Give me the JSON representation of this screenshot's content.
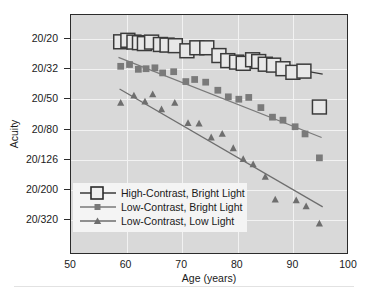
{
  "chart_data": {
    "type": "scatter",
    "title": "",
    "xlabel": "Age (years)",
    "ylabel": "Acuity",
    "xlim": [
      50,
      100
    ],
    "ylim_index": [
      0,
      6
    ],
    "grid": true,
    "legend_position": "lower-left",
    "xticks": [
      50,
      60,
      70,
      80,
      90,
      100
    ],
    "xtick_labels": [
      "50",
      "60",
      "70",
      "80",
      "90",
      "100"
    ],
    "ytick_labels": [
      "20/20",
      "20/32",
      "20/50",
      "20/80",
      "20/126",
      "20/200",
      "20/320"
    ],
    "ytick_index": [
      0,
      1,
      2,
      3,
      4,
      5,
      6
    ],
    "series": [
      {
        "name": "High-Contrast, Bright Light",
        "marker": "open-square",
        "marker_size": 7,
        "color": "#3a3a3a",
        "fill": "#e8e8e8",
        "points": [
          {
            "x": 59.0,
            "y": 0.1
          },
          {
            "x": 60.3,
            "y": 0.05
          },
          {
            "x": 61.4,
            "y": 0.11
          },
          {
            "x": 62.4,
            "y": 0.13
          },
          {
            "x": 63.3,
            "y": 0.16
          },
          {
            "x": 64.6,
            "y": 0.11
          },
          {
            "x": 66.2,
            "y": 0.19
          },
          {
            "x": 67.4,
            "y": 0.21
          },
          {
            "x": 68.9,
            "y": 0.23
          },
          {
            "x": 71.0,
            "y": 0.4
          },
          {
            "x": 72.8,
            "y": 0.3
          },
          {
            "x": 74.6,
            "y": 0.3
          },
          {
            "x": 76.8,
            "y": 0.56
          },
          {
            "x": 78.4,
            "y": 0.73
          },
          {
            "x": 80.0,
            "y": 0.78
          },
          {
            "x": 81.2,
            "y": 0.82
          },
          {
            "x": 82.9,
            "y": 0.7
          },
          {
            "x": 84.0,
            "y": 0.76
          },
          {
            "x": 85.2,
            "y": 0.85
          },
          {
            "x": 86.7,
            "y": 0.88
          },
          {
            "x": 88.4,
            "y": 1.0
          },
          {
            "x": 90.2,
            "y": 1.12
          },
          {
            "x": 92.2,
            "y": 1.08
          },
          {
            "x": 95.0,
            "y": 2.28
          }
        ],
        "fit_line": {
          "x0": 58.6,
          "y0": -0.05,
          "x1": 95.6,
          "y1": 1.18
        }
      },
      {
        "name": "Low-Contrast, Bright Light",
        "marker": "filled-square",
        "marker_size": 3.4,
        "color": "#7a7a7a",
        "points": [
          {
            "x": 59.0,
            "y": 0.92
          },
          {
            "x": 60.6,
            "y": 0.86
          },
          {
            "x": 62.2,
            "y": 1.02
          },
          {
            "x": 63.6,
            "y": 1.0
          },
          {
            "x": 65.2,
            "y": 0.97
          },
          {
            "x": 66.6,
            "y": 1.14
          },
          {
            "x": 68.6,
            "y": 1.1
          },
          {
            "x": 70.8,
            "y": 1.43
          },
          {
            "x": 72.4,
            "y": 1.36
          },
          {
            "x": 74.4,
            "y": 1.45
          },
          {
            "x": 76.6,
            "y": 1.72
          },
          {
            "x": 78.5,
            "y": 1.94
          },
          {
            "x": 80.4,
            "y": 2.02
          },
          {
            "x": 82.2,
            "y": 1.96
          },
          {
            "x": 84.4,
            "y": 2.3
          },
          {
            "x": 86.5,
            "y": 2.62
          },
          {
            "x": 88.4,
            "y": 2.72
          },
          {
            "x": 90.6,
            "y": 2.94
          },
          {
            "x": 92.4,
            "y": 3.18
          },
          {
            "x": 95.0,
            "y": 3.98
          }
        ],
        "fit_line": {
          "x0": 58.6,
          "y0": 0.62,
          "x1": 95.4,
          "y1": 3.3
        }
      },
      {
        "name": "Low-Contrast, Low Light",
        "marker": "filled-triangle",
        "marker_size": 3.6,
        "color": "#6e6e6e",
        "points": [
          {
            "x": 59.0,
            "y": 2.14
          },
          {
            "x": 61.4,
            "y": 1.9
          },
          {
            "x": 63.4,
            "y": 2.1
          },
          {
            "x": 64.8,
            "y": 1.86
          },
          {
            "x": 66.4,
            "y": 2.36
          },
          {
            "x": 68.8,
            "y": 2.14
          },
          {
            "x": 71.2,
            "y": 2.82
          },
          {
            "x": 73.2,
            "y": 2.84
          },
          {
            "x": 75.4,
            "y": 3.3
          },
          {
            "x": 77.4,
            "y": 3.18
          },
          {
            "x": 79.4,
            "y": 3.66
          },
          {
            "x": 81.2,
            "y": 4.02
          },
          {
            "x": 83.0,
            "y": 4.2
          },
          {
            "x": 85.2,
            "y": 4.62
          },
          {
            "x": 87.0,
            "y": 5.38
          },
          {
            "x": 90.8,
            "y": 5.4
          },
          {
            "x": 92.6,
            "y": 5.6
          },
          {
            "x": 95.0,
            "y": 6.18
          }
        ],
        "fit_line": {
          "x0": 58.8,
          "y0": 1.68,
          "x1": 95.6,
          "y1": 5.62
        }
      }
    ]
  },
  "legend": {
    "items": [
      {
        "label": "High-Contrast, Bright Light",
        "marker": "open-square"
      },
      {
        "label": "Low-Contrast, Bright Light",
        "marker": "filled-square"
      },
      {
        "label": "Low-Contrast, Low Light",
        "marker": "filled-triangle"
      }
    ]
  }
}
